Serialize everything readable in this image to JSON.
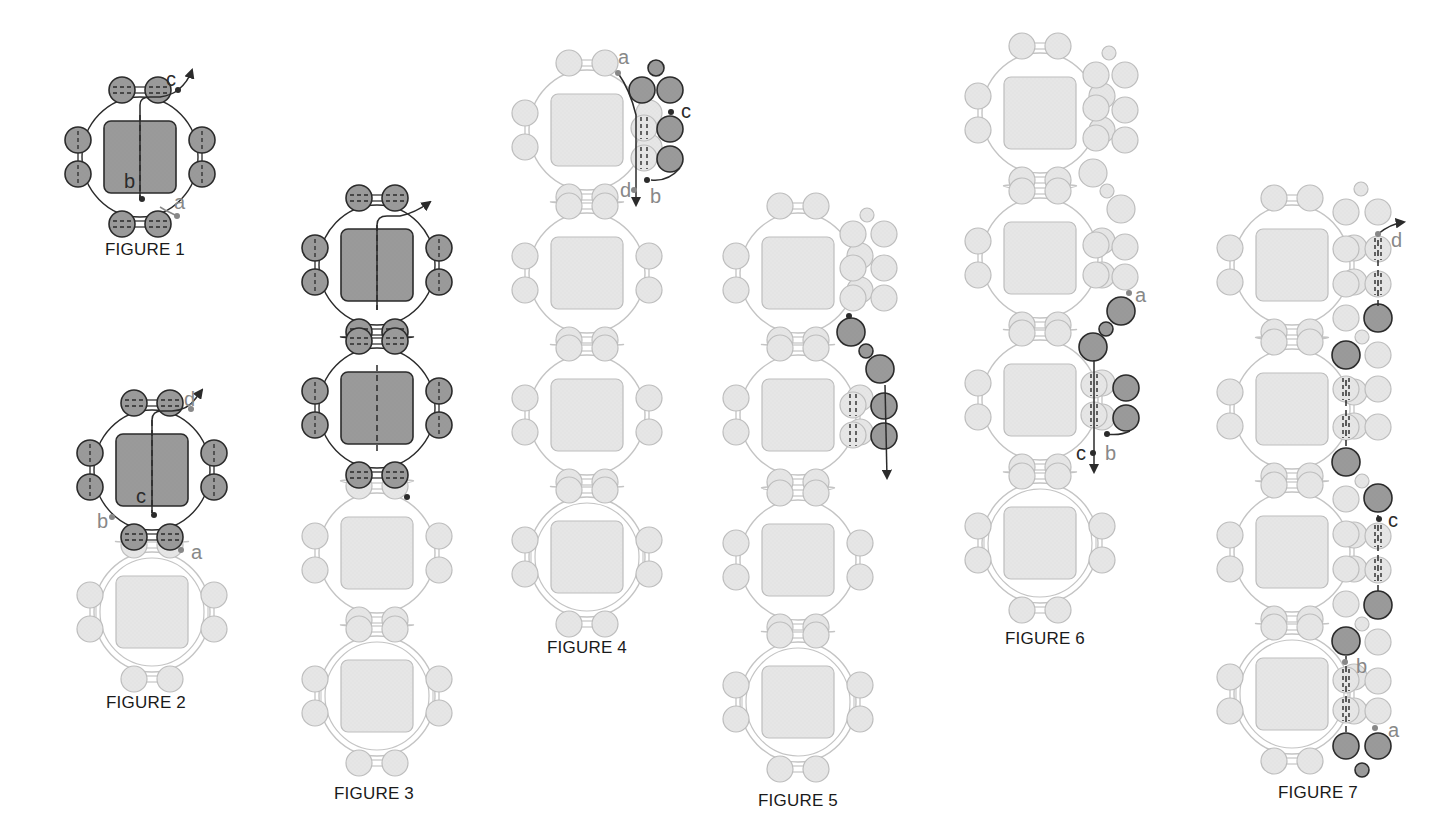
{
  "colors": {
    "dark_fill": "#9a9a9a",
    "dark_stroke": "#2b2b2b",
    "light_fill": "#e6e6e6",
    "light_stroke": "#bdbdbd",
    "thread_dark": "#2b2b2b",
    "thread_light": "#c4c4c4",
    "label_dark": "#2b2b2b",
    "label_gray": "#888888"
  },
  "figures": [
    {
      "id": 1,
      "caption": "FIGURE 1",
      "caption_x": 145,
      "caption_y": 249,
      "units": [
        {
          "cx": 140,
          "cy": 157,
          "state": "dark"
        }
      ],
      "extras": [],
      "paths": [
        {
          "d": "M177 216 L165 210 L160 207",
          "tone": "light"
        },
        {
          "d": "M140 200 L140 105 Q140 97 150 97 L160 97 Q172 95 178 90 Q188 82 192 70",
          "tone": "dark",
          "arrow": true
        },
        {
          "d": "M140 115 L140 200",
          "tone": "dark",
          "dash": true
        }
      ],
      "dots": [
        {
          "x": 178,
          "y": 90,
          "tone": "dark"
        },
        {
          "x": 142,
          "y": 199,
          "tone": "dark"
        },
        {
          "x": 177,
          "y": 216,
          "tone": "light"
        }
      ],
      "labels": [
        {
          "text": "c",
          "x": 166,
          "y": 86,
          "tone": "dark"
        },
        {
          "text": "b",
          "x": 124,
          "y": 188,
          "tone": "dark"
        },
        {
          "text": "a",
          "x": 174,
          "y": 209,
          "tone": "gray"
        }
      ]
    },
    {
      "id": 2,
      "caption": "FIGURE 2",
      "caption_x": 146,
      "caption_y": 702,
      "units": [
        {
          "cx": 152,
          "cy": 470,
          "state": "dark"
        },
        {
          "cx": 152,
          "cy": 612,
          "state": "light",
          "double": true
        }
      ],
      "extras": [],
      "paths": [
        {
          "d": "M152 513 L152 420 Q152 411 162 411 L172 411 Q188 410 196 398 L202 390",
          "tone": "dark",
          "arrow": true
        },
        {
          "d": "M152 420 L152 513",
          "tone": "dark",
          "dash": true
        }
      ],
      "dots": [
        {
          "x": 191,
          "y": 409,
          "tone": "gray"
        },
        {
          "x": 154,
          "y": 515,
          "tone": "dark"
        },
        {
          "x": 112,
          "y": 517,
          "tone": "gray"
        },
        {
          "x": 181,
          "y": 550,
          "tone": "gray"
        }
      ],
      "labels": [
        {
          "text": "d",
          "x": 184,
          "y": 406,
          "tone": "gray"
        },
        {
          "text": "c",
          "x": 136,
          "y": 503,
          "tone": "dark"
        },
        {
          "text": "b",
          "x": 97,
          "y": 528,
          "tone": "gray"
        },
        {
          "text": "a",
          "x": 191,
          "y": 559,
          "tone": "gray"
        }
      ]
    },
    {
      "id": 3,
      "caption": "FIGURE 3",
      "caption_x": 374,
      "caption_y": 793,
      "units": [
        {
          "cx": 377,
          "cy": 265,
          "state": "dark"
        },
        {
          "cx": 377,
          "cy": 408,
          "state": "dark"
        },
        {
          "cx": 377,
          "cy": 553,
          "state": "light"
        },
        {
          "cx": 377,
          "cy": 696,
          "state": "light",
          "double": true
        }
      ],
      "extras": [],
      "paths": [
        {
          "d": "M377 310 L377 225 Q377 216 387 216 L400 216 Q415 213 430 202",
          "tone": "dark",
          "arrow": true
        },
        {
          "d": "M377 225 L377 310",
          "tone": "dark",
          "dash": true
        },
        {
          "d": "M377 365 L377 452",
          "tone": "dark",
          "dash": true
        }
      ],
      "dots": [
        {
          "x": 407,
          "y": 497,
          "tone": "dark"
        }
      ],
      "labels": []
    },
    {
      "id": 4,
      "caption": "FIGURE 4",
      "caption_x": 587,
      "caption_y": 647,
      "units": [
        {
          "cx": 587,
          "cy": 130,
          "state": "light"
        },
        {
          "cx": 587,
          "cy": 273,
          "state": "light"
        },
        {
          "cx": 587,
          "cy": 415,
          "state": "light"
        },
        {
          "cx": 587,
          "cy": 557,
          "state": "light",
          "double": true
        }
      ],
      "extras": [
        {
          "x": 656,
          "y": 68,
          "r": 8,
          "state": "dark"
        },
        {
          "x": 642,
          "y": 90,
          "r": 13,
          "state": "dark"
        },
        {
          "x": 670,
          "y": 90,
          "r": 13,
          "state": "dark"
        },
        {
          "x": 644,
          "y": 128,
          "r": 13,
          "state": "light",
          "dash": true
        },
        {
          "x": 670,
          "y": 129,
          "r": 13,
          "state": "dark"
        },
        {
          "x": 644,
          "y": 158,
          "r": 13,
          "state": "light",
          "dash": true
        },
        {
          "x": 670,
          "y": 159,
          "r": 13,
          "state": "dark"
        }
      ],
      "paths": [
        {
          "d": "M618 73 Q630 90 636 115 L636 205",
          "tone": "dark",
          "arrow": true
        },
        {
          "d": "M651 180 Q668 182 680 168",
          "tone": "dark"
        }
      ],
      "dots": [
        {
          "x": 618,
          "y": 73,
          "tone": "gray"
        },
        {
          "x": 671,
          "y": 112,
          "tone": "dark"
        },
        {
          "x": 647,
          "y": 180,
          "tone": "dark"
        },
        {
          "x": 634,
          "y": 190,
          "tone": "gray"
        }
      ],
      "labels": [
        {
          "text": "a",
          "x": 618,
          "y": 64,
          "tone": "gray"
        },
        {
          "text": "c",
          "x": 681,
          "y": 118,
          "tone": "dark"
        },
        {
          "text": "b",
          "x": 650,
          "y": 203,
          "tone": "gray"
        },
        {
          "text": "d",
          "x": 620,
          "y": 197,
          "tone": "gray"
        }
      ]
    },
    {
      "id": 5,
      "caption": "FIGURE 5",
      "caption_x": 798,
      "caption_y": 800,
      "units": [
        {
          "cx": 798,
          "cy": 273,
          "state": "light"
        },
        {
          "cx": 798,
          "cy": 415,
          "state": "light"
        },
        {
          "cx": 798,
          "cy": 560,
          "state": "light"
        },
        {
          "cx": 798,
          "cy": 702,
          "state": "light",
          "double": true
        }
      ],
      "extras": [
        {
          "x": 867,
          "y": 215,
          "r": 7,
          "state": "light"
        },
        {
          "x": 853,
          "y": 234,
          "r": 13,
          "state": "light"
        },
        {
          "x": 884,
          "y": 234,
          "r": 13,
          "state": "light"
        },
        {
          "x": 853,
          "y": 268,
          "r": 13,
          "state": "light"
        },
        {
          "x": 884,
          "y": 268,
          "r": 13,
          "state": "light"
        },
        {
          "x": 853,
          "y": 298,
          "r": 13,
          "state": "light"
        },
        {
          "x": 884,
          "y": 298,
          "r": 13,
          "state": "light"
        },
        {
          "x": 851,
          "y": 332,
          "r": 14,
          "state": "dark"
        },
        {
          "x": 866,
          "y": 351,
          "r": 7,
          "state": "dark"
        },
        {
          "x": 880,
          "y": 369,
          "r": 14,
          "state": "dark"
        },
        {
          "x": 853,
          "y": 405,
          "r": 13,
          "state": "light",
          "dash": true
        },
        {
          "x": 884,
          "y": 406,
          "r": 13,
          "state": "dark"
        },
        {
          "x": 853,
          "y": 435,
          "r": 13,
          "state": "light",
          "dash": true
        },
        {
          "x": 884,
          "y": 436,
          "r": 13,
          "state": "dark"
        }
      ],
      "paths": [
        {
          "d": "M885 385 L887 478",
          "tone": "dark",
          "arrow": true
        }
      ],
      "dots": [
        {
          "x": 849,
          "y": 316,
          "tone": "dark"
        }
      ],
      "labels": []
    },
    {
      "id": 6,
      "caption": "FIGURE 6",
      "caption_x": 1045,
      "caption_y": 638,
      "units": [
        {
          "cx": 1040,
          "cy": 113,
          "state": "light"
        },
        {
          "cx": 1040,
          "cy": 258,
          "state": "light"
        },
        {
          "cx": 1040,
          "cy": 400,
          "state": "light"
        },
        {
          "cx": 1040,
          "cy": 543,
          "state": "light",
          "double": true
        }
      ],
      "extras": [
        {
          "x": 1109,
          "y": 53,
          "r": 7,
          "state": "light"
        },
        {
          "x": 1096,
          "y": 75,
          "r": 13,
          "state": "light"
        },
        {
          "x": 1125,
          "y": 75,
          "r": 13,
          "state": "light"
        },
        {
          "x": 1096,
          "y": 108,
          "r": 13,
          "state": "light"
        },
        {
          "x": 1125,
          "y": 110,
          "r": 13,
          "state": "light"
        },
        {
          "x": 1096,
          "y": 138,
          "r": 13,
          "state": "light"
        },
        {
          "x": 1125,
          "y": 140,
          "r": 13,
          "state": "light"
        },
        {
          "x": 1093,
          "y": 173,
          "r": 14,
          "state": "light"
        },
        {
          "x": 1107,
          "y": 191,
          "r": 7,
          "state": "light"
        },
        {
          "x": 1121,
          "y": 209,
          "r": 14,
          "state": "light"
        },
        {
          "x": 1096,
          "y": 245,
          "r": 13,
          "state": "light"
        },
        {
          "x": 1125,
          "y": 247,
          "r": 13,
          "state": "light"
        },
        {
          "x": 1096,
          "y": 275,
          "r": 13,
          "state": "light"
        },
        {
          "x": 1125,
          "y": 277,
          "r": 13,
          "state": "light"
        },
        {
          "x": 1121,
          "y": 311,
          "r": 14,
          "state": "dark"
        },
        {
          "x": 1106,
          "y": 329,
          "r": 7,
          "state": "dark"
        },
        {
          "x": 1093,
          "y": 347,
          "r": 14,
          "state": "dark"
        },
        {
          "x": 1094,
          "y": 385,
          "r": 13,
          "state": "light",
          "dash": true
        },
        {
          "x": 1126,
          "y": 388,
          "r": 13,
          "state": "dark"
        },
        {
          "x": 1094,
          "y": 415,
          "r": 13,
          "state": "light",
          "dash": true
        },
        {
          "x": 1126,
          "y": 418,
          "r": 13,
          "state": "dark"
        }
      ],
      "paths": [
        {
          "d": "M1094 360 L1094 472",
          "tone": "dark",
          "arrow": true
        },
        {
          "d": "M1106 434 Q1120 436 1130 431",
          "tone": "dark"
        }
      ],
      "dots": [
        {
          "x": 1129,
          "y": 293,
          "tone": "gray"
        },
        {
          "x": 1107,
          "y": 434,
          "tone": "dark"
        },
        {
          "x": 1093,
          "y": 453,
          "tone": "dark"
        }
      ],
      "labels": [
        {
          "text": "a",
          "x": 1135,
          "y": 302,
          "tone": "gray"
        },
        {
          "text": "b",
          "x": 1105,
          "y": 460,
          "tone": "gray"
        },
        {
          "text": "c",
          "x": 1076,
          "y": 460,
          "tone": "dark"
        }
      ]
    },
    {
      "id": 7,
      "caption": "FIGURE 7",
      "caption_x": 1318,
      "caption_y": 792,
      "units": [
        {
          "cx": 1292,
          "cy": 265,
          "state": "light"
        },
        {
          "cx": 1292,
          "cy": 409,
          "state": "light"
        },
        {
          "cx": 1292,
          "cy": 552,
          "state": "light"
        },
        {
          "cx": 1292,
          "cy": 694,
          "state": "light",
          "double": true
        }
      ],
      "extras": [
        {
          "x": 1361,
          "y": 189,
          "r": 7,
          "state": "light"
        },
        {
          "x": 1346,
          "y": 212,
          "r": 13,
          "state": "light"
        },
        {
          "x": 1378,
          "y": 212,
          "r": 13,
          "state": "light"
        },
        {
          "x": 1346,
          "y": 249,
          "r": 13,
          "state": "light"
        },
        {
          "x": 1378,
          "y": 249,
          "r": 13,
          "state": "light",
          "dash": true
        },
        {
          "x": 1346,
          "y": 284,
          "r": 13,
          "state": "light"
        },
        {
          "x": 1378,
          "y": 284,
          "r": 13,
          "state": "light",
          "dash": true
        },
        {
          "x": 1346,
          "y": 318,
          "r": 13,
          "state": "light"
        },
        {
          "x": 1378,
          "y": 318,
          "r": 14,
          "state": "dark"
        },
        {
          "x": 1362,
          "y": 337,
          "r": 7,
          "state": "light"
        },
        {
          "x": 1346,
          "y": 355,
          "r": 14,
          "state": "dark"
        },
        {
          "x": 1378,
          "y": 355,
          "r": 13,
          "state": "light"
        },
        {
          "x": 1346,
          "y": 389,
          "r": 13,
          "state": "light",
          "dash": true
        },
        {
          "x": 1378,
          "y": 389,
          "r": 13,
          "state": "light"
        },
        {
          "x": 1346,
          "y": 427,
          "r": 13,
          "state": "light",
          "dash": true
        },
        {
          "x": 1378,
          "y": 427,
          "r": 13,
          "state": "light"
        },
        {
          "x": 1346,
          "y": 462,
          "r": 14,
          "state": "dark"
        },
        {
          "x": 1362,
          "y": 481,
          "r": 7,
          "state": "light"
        },
        {
          "x": 1378,
          "y": 498,
          "r": 14,
          "state": "dark"
        },
        {
          "x": 1346,
          "y": 499,
          "r": 13,
          "state": "light"
        },
        {
          "x": 1378,
          "y": 536,
          "r": 13,
          "state": "light",
          "dash": true
        },
        {
          "x": 1346,
          "y": 534,
          "r": 13,
          "state": "light"
        },
        {
          "x": 1378,
          "y": 570,
          "r": 13,
          "state": "light",
          "dash": true
        },
        {
          "x": 1346,
          "y": 569,
          "r": 13,
          "state": "light"
        },
        {
          "x": 1378,
          "y": 605,
          "r": 14,
          "state": "dark"
        },
        {
          "x": 1346,
          "y": 604,
          "r": 13,
          "state": "light"
        },
        {
          "x": 1362,
          "y": 624,
          "r": 7,
          "state": "light"
        },
        {
          "x": 1346,
          "y": 641,
          "r": 14,
          "state": "dark"
        },
        {
          "x": 1378,
          "y": 642,
          "r": 13,
          "state": "light"
        },
        {
          "x": 1346,
          "y": 680,
          "r": 13,
          "state": "light",
          "dash": true
        },
        {
          "x": 1378,
          "y": 681,
          "r": 13,
          "state": "light"
        },
        {
          "x": 1346,
          "y": 710,
          "r": 13,
          "state": "light",
          "dash": true
        },
        {
          "x": 1378,
          "y": 711,
          "r": 13,
          "state": "light"
        },
        {
          "x": 1346,
          "y": 746,
          "r": 13,
          "state": "dark"
        },
        {
          "x": 1378,
          "y": 746,
          "r": 13,
          "state": "dark"
        },
        {
          "x": 1362,
          "y": 770,
          "r": 7,
          "state": "dark"
        }
      ],
      "paths": [
        {
          "d": "M1378 240 L1378 308",
          "tone": "dark",
          "dash": true
        },
        {
          "d": "M1378 234 Q1390 224 1404 222",
          "tone": "dark",
          "arrow": true
        },
        {
          "d": "M1346 380 L1346 450",
          "tone": "dark",
          "dash": true
        },
        {
          "d": "M1378 515 L1378 592",
          "tone": "dark",
          "dash": true
        },
        {
          "d": "M1346 656 L1346 735",
          "tone": "dark",
          "dash": true
        }
      ],
      "dots": [
        {
          "x": 1378,
          "y": 234,
          "tone": "gray"
        },
        {
          "x": 1379,
          "y": 519,
          "tone": "dark"
        },
        {
          "x": 1345,
          "y": 662,
          "tone": "gray"
        },
        {
          "x": 1375,
          "y": 728,
          "tone": "gray"
        }
      ],
      "labels": [
        {
          "text": "d",
          "x": 1391,
          "y": 247,
          "tone": "gray"
        },
        {
          "text": "c",
          "x": 1388,
          "y": 527,
          "tone": "dark"
        },
        {
          "text": "b",
          "x": 1356,
          "y": 673,
          "tone": "gray"
        },
        {
          "text": "a",
          "x": 1388,
          "y": 737,
          "tone": "gray"
        }
      ]
    }
  ]
}
